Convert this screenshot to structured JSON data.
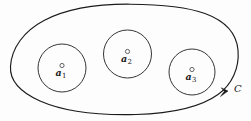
{
  "figure": {
    "type": "contour-diagram",
    "background_color": "#fdfdfd",
    "stroke_color": "#1b1b1b",
    "contour": {
      "name": "outer-contour",
      "label": "C",
      "orientation": "counterclockwise",
      "has_arrow": true,
      "arrow_position": {
        "x": 228,
        "y": 92
      },
      "label_position": {
        "x": 234,
        "y": 84
      },
      "path": "M 10.5 66.5 C 11.5 48.0 24.0 31.0 44.0 20.5 C 66.0 9.0 98.0 4.0 130.0 4.2 C 160.0 4.4 186.0 6.5 205.0 13.5 C 224.0 20.5 236.5 33.0 238.0 50.0 C 239.6 68.0 232.0 84.5 218.0 94.5 C 200.0 107.5 170.0 113.5 136.0 114.5 C 100.0 115.5 64.0 111.5 40.0 101.0 C 20.0 92.0 9.6 81.0 10.5 66.5 Z"
    },
    "inner_circles": [
      {
        "name": "circle-a1",
        "label": "a",
        "subscript": "1",
        "center": {
          "x": 62,
          "y": 68
        },
        "radius": 24,
        "point_marker": {
          "x": 62,
          "y": 65.5,
          "radius": 2.1
        },
        "label_position": {
          "x": 55.5,
          "y": 67.5
        }
      },
      {
        "name": "circle-a2",
        "label": "a",
        "subscript": "2",
        "center": {
          "x": 127.5,
          "y": 54
        },
        "radius": 24,
        "point_marker": {
          "x": 127.5,
          "y": 51.5,
          "radius": 2.1
        },
        "label_position": {
          "x": 121,
          "y": 53.5
        }
      },
      {
        "name": "circle-a3",
        "label": "a",
        "subscript": "3",
        "center": {
          "x": 192,
          "y": 72
        },
        "radius": 23,
        "point_marker": {
          "x": 192,
          "y": 69.5,
          "radius": 2.1
        },
        "label_position": {
          "x": 185.5,
          "y": 71.5
        }
      }
    ]
  }
}
